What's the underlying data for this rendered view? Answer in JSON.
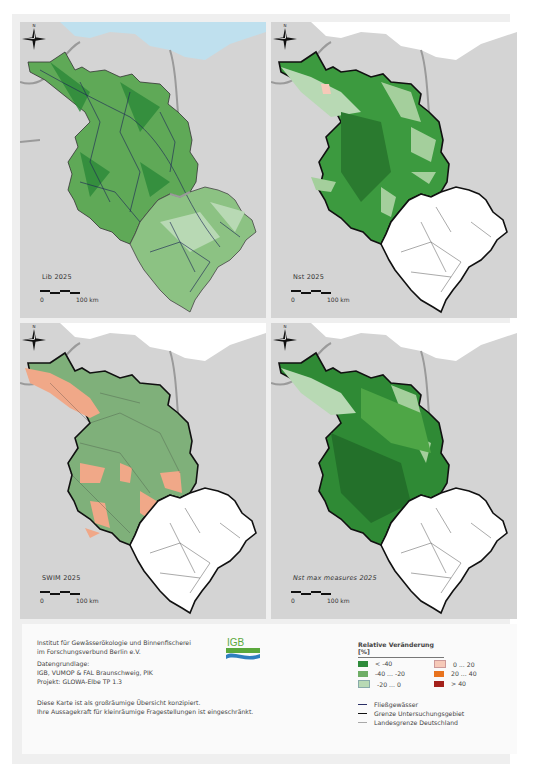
{
  "panels": [
    {
      "id": "lib",
      "label": "Lib 2025",
      "italic": false,
      "scale_zero": "0",
      "scale_max": "100 km"
    },
    {
      "id": "nst",
      "label": "Nst 2025",
      "italic": false,
      "scale_zero": "0",
      "scale_max": "100 km"
    },
    {
      "id": "swim",
      "label": "SWIM 2025",
      "italic": false,
      "scale_zero": "0",
      "scale_max": "100 km"
    },
    {
      "id": "nst-max",
      "label": "Nst max measures 2025",
      "italic": true,
      "scale_zero": "0",
      "scale_max": "100 km"
    }
  ],
  "compass": {
    "label": "N"
  },
  "footer": {
    "institute_line1": "Institut für Gewässerökologie und Binnenfischerei",
    "institute_line2": "im Forschungsverbund Berlin e.V.",
    "logo_text": "IGB",
    "data_heading": "Datengrundlage:",
    "data_sources": "IGB, VUMOP & FAL Braunschweig, PIK",
    "project": "Projekt: GLOWA-Elbe TP 1.3",
    "disclaimer_line1": "Diese Karte ist als großräumige Übersicht konzipiert.",
    "disclaimer_line2": "Ihre Aussagekraft für kleinräumige Fragestellungen ist eingeschränkt."
  },
  "legend": {
    "title": "Relative Veränderung [%]",
    "classes": [
      {
        "label": "< -40",
        "color": "#2e8b3a"
      },
      {
        "label": "-40 ... -20",
        "color": "#6fae66"
      },
      {
        "label": "-20 ... 0",
        "color": "#b8d9b4"
      },
      {
        "label": "0 ... 20",
        "color": "#f6c9b8"
      },
      {
        "label": "20 ... 40",
        "color": "#e8731e"
      },
      {
        "label": "> 40",
        "color": "#a3201a"
      }
    ],
    "lines": [
      {
        "label": "Fließgewässer",
        "color": "#2a2f66"
      },
      {
        "label": "Grenze Untersuchungsgebiet",
        "color": "#111111"
      },
      {
        "label": "Landesgrenze Deutschland",
        "color": "#a8a8a8"
      }
    ]
  },
  "colors": {
    "background_land": "#d4d4d4",
    "sea": "#bfe0ee",
    "state_border": "#9a9a9a",
    "czech_part": "#ffffff"
  }
}
